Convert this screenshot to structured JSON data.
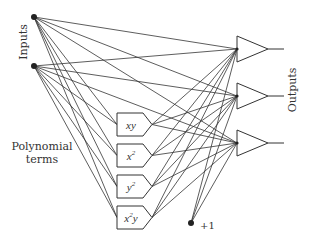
{
  "labels": {
    "inputs": "Inputs",
    "outputs": "Outputs",
    "polynomial_line1": "Polynomial",
    "polynomial_line2": "terms",
    "bias": "+1"
  },
  "colors": {
    "line": "#333333",
    "node": "#222222",
    "text": "#333333",
    "background": "#ffffff"
  },
  "inputs": [
    {
      "id": "in1",
      "x": 34,
      "y": 17
    },
    {
      "id": "in2",
      "x": 34,
      "y": 66
    }
  ],
  "polynomial_terms": [
    {
      "id": "xy",
      "base": "xy",
      "sup": "",
      "tail": "",
      "y_top": 113
    },
    {
      "id": "x2",
      "base": "x",
      "sup": "2",
      "tail": "",
      "y_top": 144
    },
    {
      "id": "y2",
      "base": "y",
      "sup": "2",
      "tail": "",
      "y_top": 175
    },
    {
      "id": "x2y",
      "base": "x",
      "sup": "2",
      "tail": "y",
      "y_top": 206
    }
  ],
  "bias": {
    "x": 191,
    "y": 223,
    "label": "+1"
  },
  "outputs": [
    {
      "id": "out1",
      "y_mid": 49
    },
    {
      "id": "out2",
      "y_mid": 96
    },
    {
      "id": "out3",
      "y_mid": 143
    }
  ]
}
